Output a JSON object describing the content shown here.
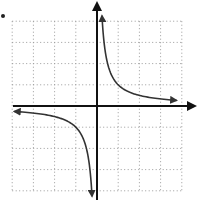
{
  "chart_data": {
    "type": "line",
    "title": "",
    "xlabel": "",
    "ylabel": "",
    "function": "y = 1/x",
    "xlim": [
      -4,
      4
    ],
    "ylim": [
      -4,
      4
    ],
    "grid": true,
    "grid_style": "dotted",
    "axes_arrows": true,
    "series": [
      {
        "name": "branch-quadrant-I",
        "x": [
          0.25,
          0.33,
          0.5,
          1,
          2,
          3,
          3.7
        ],
        "values": [
          4,
          3,
          2,
          1,
          0.5,
          0.33,
          0.27
        ]
      },
      {
        "name": "branch-quadrant-III",
        "x": [
          -3.7,
          -3,
          -2,
          -1,
          -0.5,
          -0.33,
          -0.25
        ],
        "values": [
          -0.27,
          -0.33,
          -0.5,
          -1,
          -2,
          -3,
          -4
        ]
      }
    ]
  },
  "layout": {
    "origin_px": [
      97,
      106
    ],
    "unit_px": 21.2,
    "colors": {
      "axis": "#111111",
      "curve": "#333333",
      "grid": "#9a9a9a"
    }
  }
}
